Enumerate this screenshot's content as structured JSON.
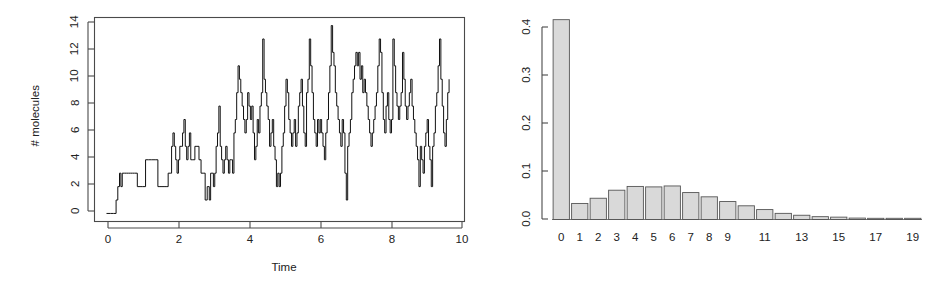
{
  "figure": {
    "background_color": "#ffffff",
    "foreground_color": "#1a1a1a",
    "panel_count": 2
  },
  "chart_data": [
    {
      "id": "trajectory",
      "type": "line",
      "title": "",
      "subtitle": "",
      "xlabel": "Time",
      "ylabel": "# molecules",
      "xlim": [
        -0.35,
        10.45
      ],
      "ylim": [
        -0.6,
        14.6
      ],
      "xticks": [
        0,
        2,
        4,
        6,
        8,
        10
      ],
      "xticklabels": [
        "0",
        "2",
        "4",
        "6",
        "8",
        "10"
      ],
      "yticks": [
        0,
        2,
        4,
        6,
        8,
        10,
        12,
        14
      ],
      "yticklabels": [
        "0",
        "2",
        "4",
        "6",
        "8",
        "10",
        "12",
        "14"
      ],
      "grid": false,
      "legend": null,
      "line_style": "step-post",
      "line_color": "#111111",
      "line_width": 1,
      "box_frame": true,
      "annotations": [],
      "description": "Stochastic (Gillespie) simulation trajectory of molecule count versus time; jump process rising from 0 and fluctuating around 6-8.",
      "x": [
        0.0,
        0.12,
        0.2,
        0.28,
        0.33,
        0.38,
        0.42,
        0.46,
        0.52,
        0.58,
        0.64,
        0.7,
        0.76,
        0.82,
        0.9,
        0.98,
        1.06,
        1.14,
        1.22,
        1.32,
        1.42,
        1.5,
        1.56,
        1.62,
        1.68,
        1.74,
        1.8,
        1.86,
        1.9,
        1.94,
        1.98,
        2.02,
        2.06,
        2.1,
        2.14,
        2.18,
        2.22,
        2.26,
        2.3,
        2.34,
        2.38,
        2.42,
        2.46,
        2.52,
        2.58,
        2.64,
        2.7,
        2.76,
        2.82,
        2.88,
        2.94,
        3.0,
        3.04,
        3.08,
        3.12,
        3.16,
        3.2,
        3.24,
        3.28,
        3.32,
        3.36,
        3.4,
        3.44,
        3.48,
        3.52,
        3.56,
        3.6,
        3.64,
        3.68,
        3.72,
        3.76,
        3.8,
        3.84,
        3.88,
        3.92,
        3.96,
        4.0,
        4.04,
        4.08,
        4.12,
        4.16,
        4.2,
        4.24,
        4.28,
        4.32,
        4.36,
        4.4,
        4.44,
        4.48,
        4.52,
        4.56,
        4.6,
        4.64,
        4.68,
        4.72,
        4.76,
        4.8,
        4.84,
        4.88,
        4.92,
        4.96,
        5.0,
        5.04,
        5.08,
        5.12,
        5.16,
        5.2,
        5.24,
        5.28,
        5.32,
        5.36,
        5.4,
        5.44,
        5.48,
        5.52,
        5.56,
        5.6,
        5.64,
        5.68,
        5.72,
        5.76,
        5.8,
        5.84,
        5.88,
        5.92,
        5.96,
        6.0,
        6.04,
        6.08,
        6.12,
        6.16,
        6.2,
        6.24,
        6.28,
        6.32,
        6.36,
        6.4,
        6.44,
        6.48,
        6.52,
        6.56,
        6.6,
        6.64,
        6.68,
        6.72,
        6.76,
        6.8,
        6.84,
        6.88,
        6.92,
        6.96,
        7.0,
        7.04,
        7.08,
        7.12,
        7.16,
        7.2,
        7.24,
        7.28,
        7.32,
        7.36,
        7.4,
        7.44,
        7.48,
        7.52,
        7.56,
        7.6,
        7.64,
        7.68,
        7.72,
        7.76,
        7.8,
        7.84,
        7.88,
        7.92,
        7.96,
        8.0,
        8.04,
        8.08,
        8.12,
        8.16,
        8.2,
        8.24,
        8.28,
        8.32,
        8.36,
        8.4,
        8.44,
        8.48,
        8.52,
        8.56,
        8.6,
        8.64,
        8.68,
        8.72,
        8.76,
        8.8,
        8.84,
        8.88,
        8.92,
        8.96,
        9.0,
        9.04,
        9.08,
        9.12,
        9.16,
        9.2,
        9.24,
        9.28,
        9.32,
        9.36,
        9.4,
        9.44,
        9.48,
        9.52,
        9.56,
        9.6,
        9.64,
        9.68,
        9.72,
        9.76,
        9.8,
        9.84,
        9.88,
        9.92,
        9.96,
        10.0
      ],
      "y": [
        0,
        0,
        0,
        1,
        2,
        3,
        2,
        3,
        3,
        3,
        3,
        3,
        3,
        3,
        2,
        2,
        2,
        4,
        4,
        4,
        4,
        2,
        2,
        2,
        2,
        2,
        3,
        3,
        5,
        6,
        5,
        4,
        3,
        4,
        5,
        5,
        6,
        7,
        5,
        4,
        5,
        6,
        4,
        4,
        5,
        5,
        4,
        3,
        3,
        1,
        2,
        1,
        3,
        3,
        2,
        3,
        5,
        6,
        8,
        5,
        4,
        3,
        4,
        5,
        4,
        3,
        4,
        4,
        3,
        6,
        7,
        9,
        11,
        10,
        9,
        8,
        7,
        6,
        7,
        9,
        8,
        7,
        8,
        6,
        4,
        5,
        7,
        6,
        8,
        9,
        13,
        10,
        9,
        8,
        7,
        5,
        6,
        7,
        5,
        4,
        2,
        3,
        2,
        3,
        5,
        6,
        8,
        10,
        9,
        7,
        6,
        5,
        6,
        7,
        5,
        6,
        8,
        9,
        10,
        8,
        6,
        5,
        9,
        10,
        13,
        11,
        9,
        7,
        6,
        5,
        7,
        6,
        7,
        6,
        5,
        4,
        6,
        7,
        9,
        11,
        14,
        12,
        11,
        9,
        8,
        7,
        6,
        5,
        7,
        6,
        3,
        1,
        5,
        6,
        7,
        9,
        10,
        11,
        12,
        11,
        12,
        10,
        11,
        9,
        10,
        9,
        8,
        7,
        6,
        5,
        6,
        7,
        8,
        9,
        11,
        13,
        12,
        9,
        7,
        6,
        8,
        9,
        7,
        6,
        7,
        13,
        11,
        9,
        8,
        7,
        8,
        9,
        12,
        10,
        8,
        7,
        8,
        9,
        10,
        8,
        7,
        6,
        5,
        4,
        2,
        5,
        4,
        3,
        5,
        6,
        7,
        5,
        4,
        2,
        5,
        6,
        8,
        9,
        11,
        13,
        10,
        8,
        6,
        5,
        7,
        9,
        10,
        8,
        7
      ]
    },
    {
      "id": "stationary-distribution",
      "type": "bar",
      "title": "",
      "subtitle": "",
      "xlabel": "",
      "ylabel": "",
      "xlim": [
        -0.8,
        20.3
      ],
      "ylim": [
        0.0,
        0.435
      ],
      "yticks": [
        0.0,
        0.1,
        0.2,
        0.3,
        0.4
      ],
      "yticklabels": [
        "0.0",
        "0.1",
        "0.2",
        "0.3",
        "0.4"
      ],
      "categories": [
        "0",
        "1",
        "2",
        "3",
        "4",
        "5",
        "6",
        "7",
        "8",
        "9",
        "10",
        "11",
        "12",
        "13",
        "14",
        "15",
        "16",
        "17",
        "18",
        "19"
      ],
      "xticklabels_shown": [
        "0",
        "1",
        "2",
        "3",
        "4",
        "5",
        "6",
        "7",
        "8",
        "9",
        "",
        "11",
        "",
        "13",
        "",
        "15",
        "",
        "17",
        "",
        "19"
      ],
      "values": [
        0.423,
        0.034,
        0.045,
        0.062,
        0.07,
        0.069,
        0.071,
        0.057,
        0.048,
        0.038,
        0.029,
        0.021,
        0.013,
        0.009,
        0.006,
        0.005,
        0.003,
        0.002,
        0.002,
        0.001
      ],
      "bar_fill_color": "#d9d9d9",
      "bar_edge_color": "#555555",
      "grid": false,
      "legend": null,
      "box_frame": false,
      "annotations": [],
      "description": "Probability histogram of molecule counts; strongly peaked at 0 (~0.42) with a small secondary mode around 4-6 and a long decaying right tail."
    }
  ],
  "panels": {
    "left": {
      "name": "trajectory-panel",
      "xlabel": "Time",
      "ylabel": "# molecules",
      "xticklabels": [
        "0",
        "2",
        "4",
        "6",
        "8",
        "10"
      ],
      "yticklabels": [
        "0",
        "2",
        "4",
        "6",
        "8",
        "10",
        "12",
        "14"
      ]
    },
    "right": {
      "name": "distribution-panel",
      "xlabel": "",
      "ylabel": "",
      "xticklabels": [
        "0",
        "1",
        "2",
        "3",
        "4",
        "5",
        "6",
        "7",
        "8",
        "9",
        "11",
        "13",
        "15",
        "17",
        "19"
      ],
      "yticklabels": [
        "0.0",
        "0.1",
        "0.2",
        "0.3",
        "0.4"
      ]
    }
  }
}
